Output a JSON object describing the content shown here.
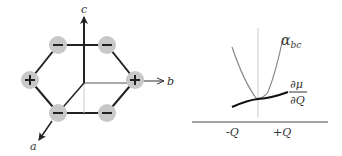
{
  "figure": {
    "left_panel": {
      "description": "hexagonal charge arrangement with crystal axes",
      "axes": [
        {
          "name": "c",
          "label": "c"
        },
        {
          "name": "b",
          "label": "b"
        },
        {
          "name": "a",
          "label": "a"
        }
      ],
      "sites": [
        {
          "position": "top-left",
          "sign": "−"
        },
        {
          "position": "top-right",
          "sign": "−"
        },
        {
          "position": "left",
          "sign": "+"
        },
        {
          "position": "right",
          "sign": "+"
        },
        {
          "position": "bottom-left",
          "sign": "−"
        },
        {
          "position": "bottom-right",
          "sign": "−"
        }
      ],
      "site_color": "#c8c8c8",
      "bond_color": "#222222"
    },
    "right_panel": {
      "curves": [
        {
          "name": "alpha_bc",
          "label_main": "α",
          "label_sub": "bc",
          "shape": "parabola",
          "color": "#888888"
        },
        {
          "name": "dmu_dQ",
          "label_num": "∂μ",
          "label_den": "∂Q",
          "shape": "nearly-flat increasing",
          "color": "#111111"
        }
      ],
      "x_ticks": [
        "-Q",
        "+Q"
      ]
    }
  }
}
